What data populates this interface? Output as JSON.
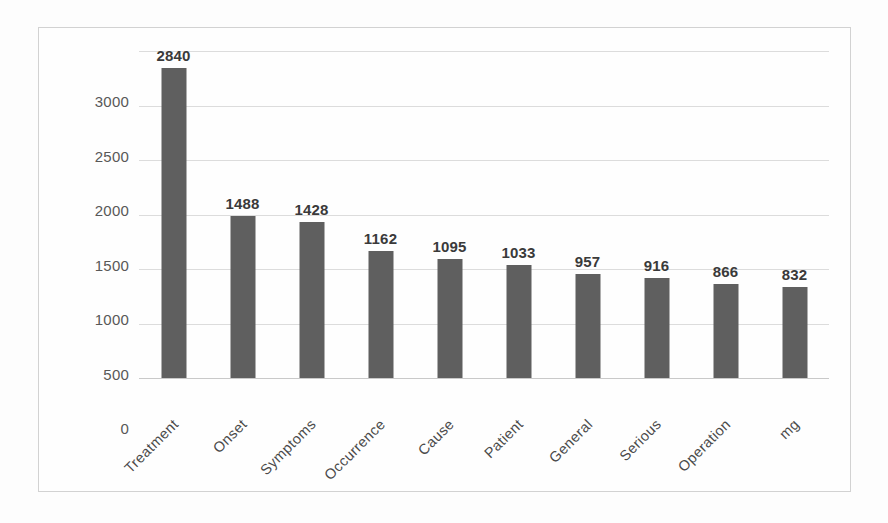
{
  "chart_data": {
    "type": "bar",
    "title": "",
    "xlabel": "",
    "ylabel": "",
    "categories": [
      "Treatment",
      "Onset",
      "Symptoms",
      "Occurrence",
      "Cause",
      "Patient",
      "General",
      "Serious",
      "Operation",
      "mg"
    ],
    "values": [
      2840,
      1488,
      1428,
      1162,
      1095,
      1033,
      957,
      916,
      866,
      832
    ],
    "value_labels": [
      "2840",
      "1488",
      "1428",
      "1162",
      "1095",
      "1033",
      "957",
      "916",
      "866",
      "832"
    ],
    "ylim": [
      0,
      3000
    ],
    "ytick_values": [
      3000,
      2500,
      2000,
      1500,
      1000,
      500,
      0
    ],
    "ytick_labels": [
      "3000",
      "2500",
      "2000",
      "1500",
      "1000",
      "500",
      "0"
    ],
    "grid": true,
    "legend": false,
    "legend_position": "none",
    "data_labels_shown": true,
    "xtick_rotation_deg": -45,
    "colors": {
      "bar": "#5f5f5f",
      "gridline": "#dcdcdc",
      "axis_line": "#c9c9c9",
      "frame_border": "#d2d2d2",
      "tick_text": "#585858",
      "value_text": "#3a3a3a",
      "category_text": "#4a4a4a",
      "plot_background": "#fefefe",
      "page_background": "#fdfdfd"
    }
  }
}
